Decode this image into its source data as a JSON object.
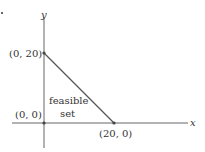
{
  "diagram": {
    "type": "feasible-set-plot",
    "axes": {
      "x_label": "x",
      "y_label": "y"
    },
    "points": [
      {
        "label": "(0, 20)",
        "x": 0,
        "y": 20
      },
      {
        "label": "(0, 0)",
        "x": 0,
        "y": 0
      },
      {
        "label": "(20, 0)",
        "x": 20,
        "y": 0
      }
    ],
    "region": {
      "label_line1": "feasible",
      "label_line2": "set"
    },
    "colors": {
      "axis": "#555555",
      "edge": "#555555",
      "point": "#444444",
      "text": "#333333"
    }
  }
}
